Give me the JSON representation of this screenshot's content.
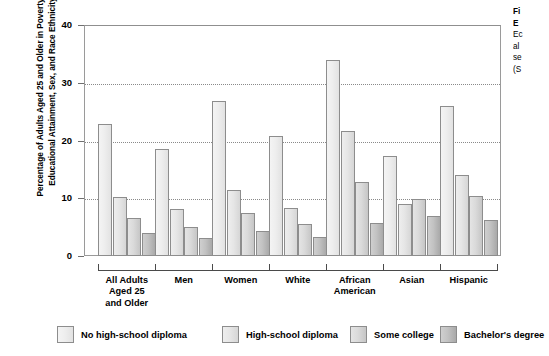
{
  "axis": {
    "y_title": "Percentage of Adults Aged 25 and Older in Poverty by Educational Attainment, Sex, and Race Ethnicity",
    "y_ticks": [
      "40",
      "30",
      "20",
      "10",
      "0"
    ]
  },
  "legend": [
    {
      "label": "No high-school diploma",
      "color": "#eeeeee"
    },
    {
      "label": "High-school diploma",
      "color": "#e6e6e6"
    },
    {
      "label": "Some college",
      "color": "#dadada"
    },
    {
      "label": "Bachelor's degree",
      "color": "#c2c2c2"
    }
  ],
  "caption_lines": [
    {
      "text": "Fi",
      "bold": true
    },
    {
      "text": "E",
      "bold": true
    },
    {
      "text": "Ec",
      "bold": false
    },
    {
      "text": "al",
      "bold": false
    },
    {
      "text": "se",
      "bold": false
    },
    {
      "text": "(S",
      "bold": false
    }
  ],
  "chart_data": {
    "type": "bar",
    "title": "",
    "xlabel": "",
    "ylabel": "Percentage of Adults Aged 25 and Older in Poverty by Educational Attainment, Sex, and Race Ethnicity",
    "ylim": [
      0,
      40
    ],
    "yticks": [
      0,
      10,
      20,
      30,
      40
    ],
    "grid": true,
    "legend_position": "bottom",
    "categories": [
      "All Adults Aged 25 and Older",
      "Men",
      "Women",
      "White",
      "African American",
      "Asian",
      "Hispanic"
    ],
    "category_lines": [
      [
        "All Adults",
        "Aged 25",
        "and Older"
      ],
      [
        "Men"
      ],
      [
        "Women"
      ],
      [
        "White"
      ],
      [
        "African",
        "American"
      ],
      [
        "Asian"
      ],
      [
        "Hispanic"
      ]
    ],
    "series": [
      {
        "name": "No high-school diploma",
        "values": [
          22.8,
          18.5,
          26.9,
          20.8,
          34.0,
          17.3,
          26.0
        ]
      },
      {
        "name": "High-school diploma",
        "values": [
          10.2,
          8.1,
          11.5,
          8.4,
          21.6,
          9.0,
          14.0
        ]
      },
      {
        "name": "Some college",
        "values": [
          6.5,
          5.0,
          7.5,
          5.5,
          12.8,
          9.9,
          10.4
        ]
      },
      {
        "name": "Bachelor's degree",
        "values": [
          4.0,
          3.2,
          4.3,
          3.3,
          5.8,
          7.0,
          6.3
        ]
      }
    ]
  }
}
